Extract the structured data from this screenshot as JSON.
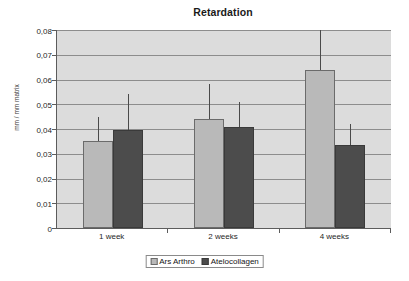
{
  "chart_data": {
    "type": "bar",
    "title": "Retardation",
    "xlabel": "",
    "ylabel": "mm / mm matrix",
    "categories": [
      "1 week",
      "2 weeks",
      "4 weeks"
    ],
    "ylim": [
      0,
      0.08
    ],
    "ytick_values": [
      0,
      0.01,
      0.02,
      0.03,
      0.04,
      0.05,
      0.06,
      0.07,
      0.08
    ],
    "ytick_labels": [
      "0",
      "0,01",
      "0,02",
      "0,03",
      "0,04",
      "0,05",
      "0,06",
      "0,07",
      "0,08"
    ],
    "grid": true,
    "legend_position": "bottom",
    "decimal_separator": ",",
    "series": [
      {
        "name": "Ars Arthro",
        "color": "#b9b9b9",
        "values": [
          0.035,
          0.044,
          0.064
        ],
        "error_high": [
          0.045,
          0.058,
          0.08
        ]
      },
      {
        "name": "Atelocollagen",
        "color": "#4c4c4c",
        "values": [
          0.0395,
          0.041,
          0.0335
        ],
        "error_high": [
          0.054,
          0.051,
          0.042
        ]
      }
    ]
  },
  "legend": {
    "entries": [
      {
        "label": "Ars Arthro"
      },
      {
        "label": "Atelocollagen"
      }
    ]
  }
}
